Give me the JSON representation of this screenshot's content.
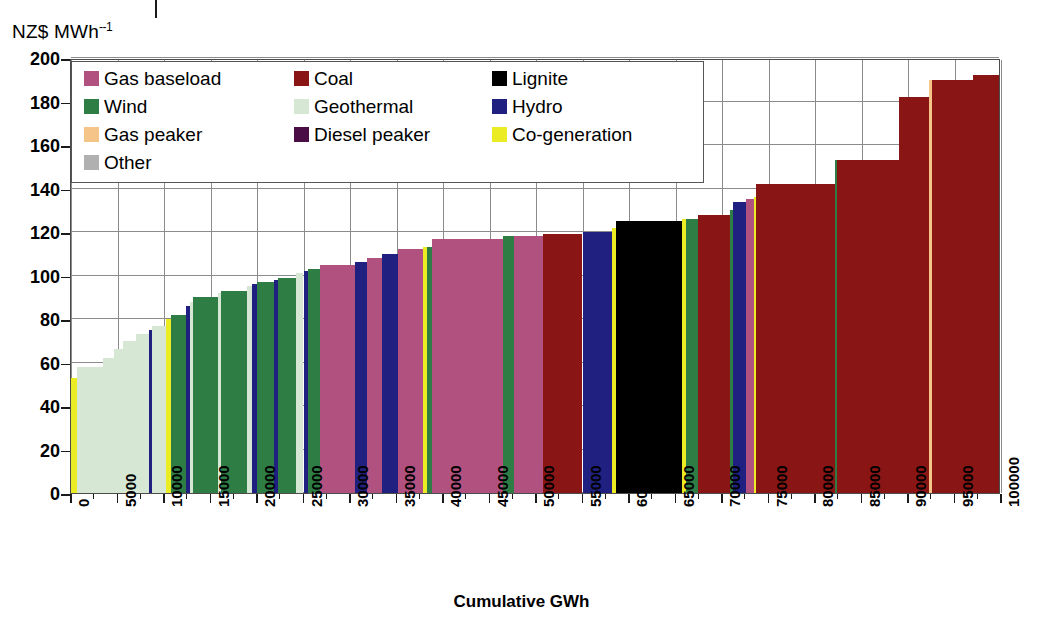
{
  "axes": {
    "y_unit_label": "NZ$ MWh",
    "y_unit_exponent": "--1",
    "x_title": "Cumulative GWh",
    "y_ticks": [
      "200",
      "180",
      "160",
      "140",
      "120",
      "100",
      "80",
      "60",
      "40",
      "20",
      "0"
    ],
    "x_ticks": [
      "0",
      "5000",
      "10000",
      "15000",
      "20000",
      "25000",
      "30000",
      "35000",
      "40000",
      "45000",
      "50000",
      "55000",
      "60000",
      "65000",
      "70000",
      "75000",
      "80000",
      "85000",
      "90000",
      "95000",
      "100000"
    ]
  },
  "legend": {
    "items": [
      {
        "label": "Gas baseload",
        "color": "#a8partially"
      },
      {
        "label": "Coal",
        "color": "#8a1515"
      },
      {
        "label": "Lignite",
        "color": "#000000"
      },
      {
        "label": "Wind",
        "color": "#2e7d45"
      },
      {
        "label": "Geothermal",
        "color": "#d6e8d4"
      },
      {
        "label": "Hydro",
        "color": "#1f2080"
      },
      {
        "label": "Gas peaker",
        "color": "#f4c488"
      },
      {
        "label": "Diesel peaker",
        "color": "#4a0d45"
      },
      {
        "label": "Co-generation",
        "color": "#ecec25"
      },
      {
        "label": "Other",
        "color": "#b0b0b0"
      }
    ]
  },
  "colors": {
    "gas_baseload": "#b0517f",
    "coal": "#8a1515",
    "lignite": "#000000",
    "wind": "#2e7d45",
    "geothermal": "#d6e8d4",
    "hydro": "#1f2080",
    "gas_peaker": "#f4c488",
    "diesel_peaker": "#4a0d45",
    "cogeneration": "#ecec25",
    "other": "#b0b0b0",
    "grid": "#8c8c8c",
    "frame": "#4c4c4c"
  },
  "chart_data": {
    "type": "bar",
    "title": "",
    "subtitle": "",
    "xlabel": "Cumulative GWh",
    "ylabel": "NZ$ MWh--1",
    "xlim": [
      0,
      100000
    ],
    "ylim": [
      0,
      200
    ],
    "grid": true,
    "legend_position": "top-left-inside",
    "note": "Electricity supply (merit-order) curve: each bar spans a cumulative GWh width at its short-run marginal cost in NZ$/MWh.",
    "x_tick_step": 5000,
    "y_tick_step": 20,
    "segments": [
      {
        "start": 0,
        "end": 600,
        "price": 53,
        "fuel": "cogeneration"
      },
      {
        "start": 600,
        "end": 3400,
        "price": 58,
        "fuel": "geothermal"
      },
      {
        "start": 3400,
        "end": 4600,
        "price": 62,
        "fuel": "geothermal"
      },
      {
        "start": 4600,
        "end": 5600,
        "price": 66,
        "fuel": "geothermal"
      },
      {
        "start": 5600,
        "end": 7000,
        "price": 70,
        "fuel": "geothermal"
      },
      {
        "start": 7000,
        "end": 8400,
        "price": 73,
        "fuel": "geothermal"
      },
      {
        "start": 8400,
        "end": 8750,
        "price": 75,
        "fuel": "hydro"
      },
      {
        "start": 8750,
        "end": 10200,
        "price": 77,
        "fuel": "geothermal"
      },
      {
        "start": 10200,
        "end": 10700,
        "price": 80,
        "fuel": "cogeneration"
      },
      {
        "start": 10700,
        "end": 12400,
        "price": 82,
        "fuel": "wind"
      },
      {
        "start": 12400,
        "end": 12750,
        "price": 86,
        "fuel": "hydro"
      },
      {
        "start": 12750,
        "end": 13100,
        "price": 88,
        "fuel": "geothermal"
      },
      {
        "start": 13100,
        "end": 15800,
        "price": 90,
        "fuel": "wind"
      },
      {
        "start": 15800,
        "end": 16100,
        "price": 92,
        "fuel": "geothermal"
      },
      {
        "start": 16100,
        "end": 18900,
        "price": 93,
        "fuel": "wind"
      },
      {
        "start": 18900,
        "end": 19500,
        "price": 95,
        "fuel": "geothermal"
      },
      {
        "start": 19500,
        "end": 20000,
        "price": 96,
        "fuel": "hydro"
      },
      {
        "start": 20000,
        "end": 21800,
        "price": 97,
        "fuel": "wind"
      },
      {
        "start": 21800,
        "end": 22300,
        "price": 98,
        "fuel": "hydro"
      },
      {
        "start": 22300,
        "end": 24200,
        "price": 99,
        "fuel": "wind"
      },
      {
        "start": 24200,
        "end": 25000,
        "price": 101,
        "fuel": "geothermal"
      },
      {
        "start": 25000,
        "end": 25500,
        "price": 102,
        "fuel": "hydro"
      },
      {
        "start": 25500,
        "end": 26800,
        "price": 103,
        "fuel": "wind"
      },
      {
        "start": 26800,
        "end": 30500,
        "price": 105,
        "fuel": "gas_baseload"
      },
      {
        "start": 30500,
        "end": 31800,
        "price": 106,
        "fuel": "hydro"
      },
      {
        "start": 31800,
        "end": 33400,
        "price": 108,
        "fuel": "gas_baseload"
      },
      {
        "start": 33400,
        "end": 35200,
        "price": 110,
        "fuel": "hydro"
      },
      {
        "start": 35200,
        "end": 37800,
        "price": 112,
        "fuel": "gas_baseload"
      },
      {
        "start": 37800,
        "end": 38300,
        "price": 113,
        "fuel": "cogeneration"
      },
      {
        "start": 38300,
        "end": 38800,
        "price": 113,
        "fuel": "wind"
      },
      {
        "start": 38800,
        "end": 46400,
        "price": 117,
        "fuel": "gas_baseload"
      },
      {
        "start": 46400,
        "end": 47600,
        "price": 118,
        "fuel": "wind"
      },
      {
        "start": 47600,
        "end": 50800,
        "price": 118,
        "fuel": "gas_baseload"
      },
      {
        "start": 50800,
        "end": 55000,
        "price": 119,
        "fuel": "coal"
      },
      {
        "start": 55000,
        "end": 58200,
        "price": 120,
        "fuel": "hydro"
      },
      {
        "start": 58200,
        "end": 58600,
        "price": 122,
        "fuel": "cogeneration"
      },
      {
        "start": 58600,
        "end": 65700,
        "price": 125,
        "fuel": "lignite"
      },
      {
        "start": 65700,
        "end": 66100,
        "price": 126,
        "fuel": "cogeneration"
      },
      {
        "start": 66100,
        "end": 67400,
        "price": 126,
        "fuel": "wind"
      },
      {
        "start": 67400,
        "end": 70900,
        "price": 128,
        "fuel": "coal"
      },
      {
        "start": 70900,
        "end": 71200,
        "price": 130,
        "fuel": "wind"
      },
      {
        "start": 71200,
        "end": 72600,
        "price": 134,
        "fuel": "hydro"
      },
      {
        "start": 72600,
        "end": 73400,
        "price": 135,
        "fuel": "gas_baseload"
      },
      {
        "start": 73400,
        "end": 73700,
        "price": 136,
        "fuel": "cogeneration"
      },
      {
        "start": 73700,
        "end": 82100,
        "price": 142,
        "fuel": "coal"
      },
      {
        "start": 82100,
        "end": 82350,
        "price": 153,
        "fuel": "wind"
      },
      {
        "start": 82350,
        "end": 89000,
        "price": 153,
        "fuel": "coal"
      },
      {
        "start": 89000,
        "end": 92300,
        "price": 182,
        "fuel": "coal"
      },
      {
        "start": 92300,
        "end": 92600,
        "price": 190,
        "fuel": "gas_peaker"
      },
      {
        "start": 92600,
        "end": 97000,
        "price": 190,
        "fuel": "coal"
      },
      {
        "start": 97000,
        "end": 100000,
        "price": 192,
        "fuel": "coal"
      }
    ]
  }
}
